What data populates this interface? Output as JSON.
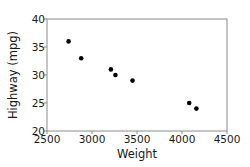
{
  "chart_data": {
    "type": "scatter",
    "title": "",
    "xlabel": "Weight",
    "ylabel": "Highway (mpg)",
    "xlim": [
      2500,
      4500
    ],
    "ylim": [
      20,
      40
    ],
    "xticks": [
      2500,
      3000,
      3500,
      4000,
      4500
    ],
    "yticks": [
      20,
      25,
      30,
      35,
      40
    ],
    "grid": false,
    "legend": null,
    "series": [
      {
        "name": "cars",
        "color": "#000000",
        "points": [
          {
            "x": 2740,
            "y": 36
          },
          {
            "x": 2880,
            "y": 33
          },
          {
            "x": 3210,
            "y": 31
          },
          {
            "x": 3260,
            "y": 30
          },
          {
            "x": 3450,
            "y": 29
          },
          {
            "x": 4080,
            "y": 25
          },
          {
            "x": 4160,
            "y": 24
          }
        ]
      }
    ]
  },
  "axes": {
    "x_label": "Weight",
    "y_label": "Highway (mpg)",
    "frame_color": "#8c8c8c"
  }
}
